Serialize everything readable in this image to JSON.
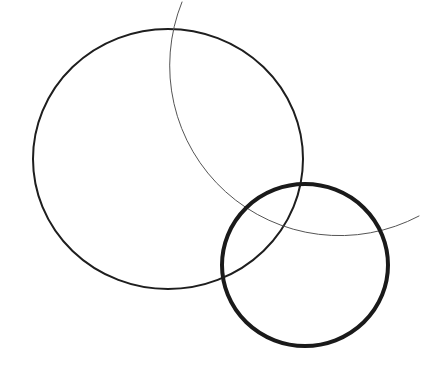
{
  "diagram": {
    "background": "#ffffff",
    "shapes": [
      {
        "id": "large-circle",
        "type": "ellipse",
        "cx": 168,
        "cy": 159,
        "rx": 135,
        "ry": 130,
        "stroke": "#1e1e1e",
        "stroke_width": 2
      },
      {
        "id": "thin-arc",
        "type": "arc",
        "cx": 340,
        "cy": 65,
        "r": 170,
        "start": [
          182,
          2
        ],
        "end": [
          419,
          216
        ],
        "stroke": "#555555",
        "stroke_width": 1
      },
      {
        "id": "thick-circle",
        "type": "ellipse",
        "cx": 305,
        "cy": 265,
        "rx": 83,
        "ry": 81,
        "stroke": "#1a1a1a",
        "stroke_width": 4
      }
    ]
  }
}
